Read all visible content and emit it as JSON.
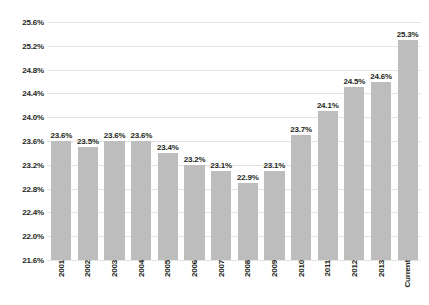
{
  "chart_data": {
    "type": "bar",
    "title": "",
    "xlabel": "",
    "ylabel": "",
    "ylim": [
      21.6,
      25.6
    ],
    "ytick_step": 0.4,
    "grid": true,
    "legend": null,
    "bar_color": "#bdbdbd",
    "gridline_color": "#e3e3e3",
    "text_color": "#231f20",
    "background": "#ffffff",
    "categories": [
      "2001",
      "2002",
      "2003",
      "2004",
      "2005",
      "2006",
      "2007",
      "2008",
      "2009",
      "2010",
      "2011",
      "2012",
      "2013",
      "Current"
    ],
    "values": [
      23.6,
      23.5,
      23.6,
      23.6,
      23.4,
      23.2,
      23.1,
      22.9,
      23.1,
      23.7,
      24.1,
      24.5,
      24.6,
      25.3
    ],
    "data_labels": [
      "23.6%",
      "23.5%",
      "23.6%",
      "23.6%",
      "23.4%",
      "23.2%",
      "23.1%",
      "22.9%",
      "23.1%",
      "23.7%",
      "24.1%",
      "24.5%",
      "24.6%",
      "25.3%"
    ],
    "ytick_labels": [
      "25.6%",
      "25.2%",
      "24.8%",
      "24.4%",
      "24.0%",
      "23.6%",
      "23.2%",
      "22.8%",
      "22.4%",
      "22.0%",
      "21.6%"
    ],
    "ytick_values": [
      25.6,
      25.2,
      24.8,
      24.4,
      24.0,
      23.6,
      23.2,
      22.8,
      22.4,
      22.0,
      21.6
    ]
  }
}
